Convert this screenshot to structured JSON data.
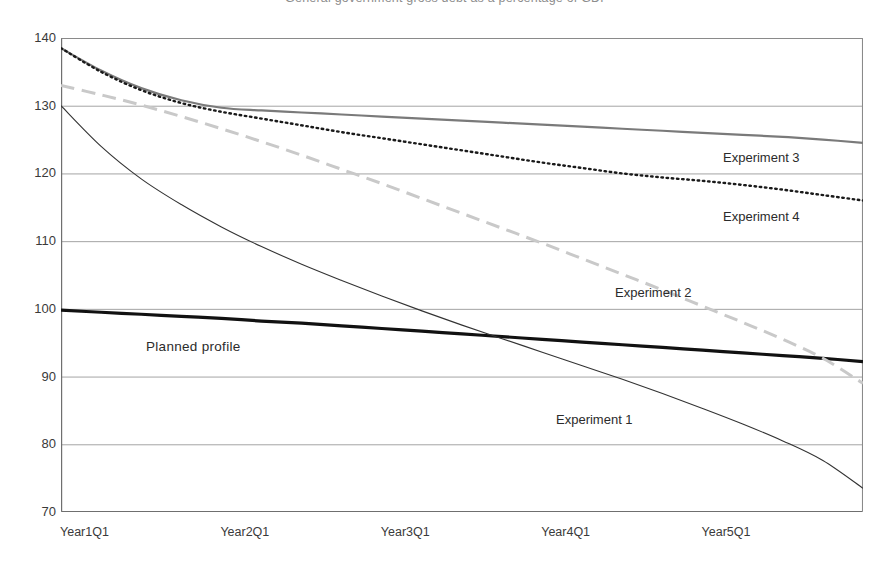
{
  "title": "General government gross debt as a percentage of GDP",
  "axes": {
    "y": {
      "label": "",
      "min": 70,
      "max": 140,
      "step": 10,
      "ticks": [
        "140",
        "130",
        "120",
        "110",
        "100",
        "90",
        "80",
        "70"
      ]
    },
    "x": {
      "label": "",
      "ticks": [
        "Year1Q1",
        "Year2Q1",
        "Year3Q1",
        "Year4Q1",
        "Year5Q1"
      ],
      "tick_positions": [
        0,
        4,
        8,
        12,
        16
      ],
      "minor_tick_count": 21
    }
  },
  "annotations": [
    {
      "text": "Planned profile",
      "x": 146,
      "y": 339
    },
    {
      "text": "Experiment 1",
      "x": 556,
      "y": 412
    },
    {
      "text": "Experiment 2",
      "x": 615,
      "y": 285
    },
    {
      "text": "Experiment 3",
      "x": 723,
      "y": 150
    },
    {
      "text": "Experiment 4",
      "x": 723,
      "y": 209
    }
  ],
  "colors": {
    "planned": "#111111",
    "experiment1": "#333333",
    "experiment2": "#c9c9c9",
    "experiment3": "#7a7a7a",
    "experiment4": "#1a1a1a",
    "gridline": "#9a9a9a",
    "frame": "#8a8a8a",
    "text": "#2b2b2b"
  },
  "chart_data": {
    "type": "line",
    "title": "General government gross debt as a percentage of GDP",
    "xlabel": "",
    "ylabel": "",
    "ylim": [
      70,
      140
    ],
    "grid": true,
    "legend": "inline-annotations",
    "x": [
      "Year1Q1",
      "Year1Q2",
      "Year1Q3",
      "Year1Q4",
      "Year2Q1",
      "Year2Q2",
      "Year2Q3",
      "Year2Q4",
      "Year3Q1",
      "Year3Q2",
      "Year3Q3",
      "Year3Q4",
      "Year4Q1",
      "Year4Q2",
      "Year4Q3",
      "Year4Q4",
      "Year5Q1",
      "Year5Q2",
      "Year5Q3",
      "Year5Q4",
      "Year6Q1"
    ],
    "series": [
      {
        "name": "Planned profile",
        "style": "solid",
        "width": 3.2,
        "color": "#111111",
        "values": [
          99.8,
          99.5,
          99.2,
          98.9,
          98.6,
          98.2,
          97.9,
          97.5,
          97.1,
          96.7,
          96.3,
          95.9,
          95.5,
          95.1,
          94.7,
          94.3,
          93.9,
          93.5,
          93.1,
          92.7,
          92.2
        ]
      },
      {
        "name": "Experiment 1",
        "style": "solid",
        "width": 1.1,
        "color": "#333333",
        "values": [
          130.0,
          124.0,
          119.2,
          115.4,
          112.1,
          109.2,
          106.6,
          104.2,
          101.9,
          99.7,
          97.6,
          95.6,
          93.6,
          91.6,
          89.6,
          87.5,
          85.3,
          83.0,
          80.5,
          77.6,
          73.5
        ]
      },
      {
        "name": "Experiment 2",
        "style": "dashed",
        "width": 3.0,
        "color": "#c9c9c9",
        "values": [
          133.0,
          131.6,
          130.1,
          128.4,
          126.6,
          124.7,
          122.7,
          120.6,
          118.5,
          116.3,
          114.1,
          111.9,
          109.7,
          107.4,
          105.1,
          102.8,
          100.4,
          98.0,
          95.5,
          92.7,
          89.0
        ]
      },
      {
        "name": "Experiment 3",
        "style": "solid",
        "width": 2.2,
        "color": "#7a7a7a",
        "values": [
          138.5,
          135.2,
          132.6,
          130.8,
          129.7,
          129.3,
          129.0,
          128.7,
          128.4,
          128.1,
          127.8,
          127.5,
          127.2,
          126.9,
          126.6,
          126.3,
          126.0,
          125.7,
          125.4,
          125.0,
          124.5
        ]
      },
      {
        "name": "Experiment 4",
        "style": "dotted",
        "width": 2.4,
        "color": "#1a1a1a",
        "values": [
          138.5,
          135.0,
          132.3,
          130.4,
          129.1,
          128.1,
          127.1,
          126.1,
          125.2,
          124.3,
          123.4,
          122.5,
          121.6,
          120.8,
          120.0,
          119.4,
          118.9,
          118.3,
          117.6,
          116.8,
          116.0
        ]
      }
    ]
  }
}
